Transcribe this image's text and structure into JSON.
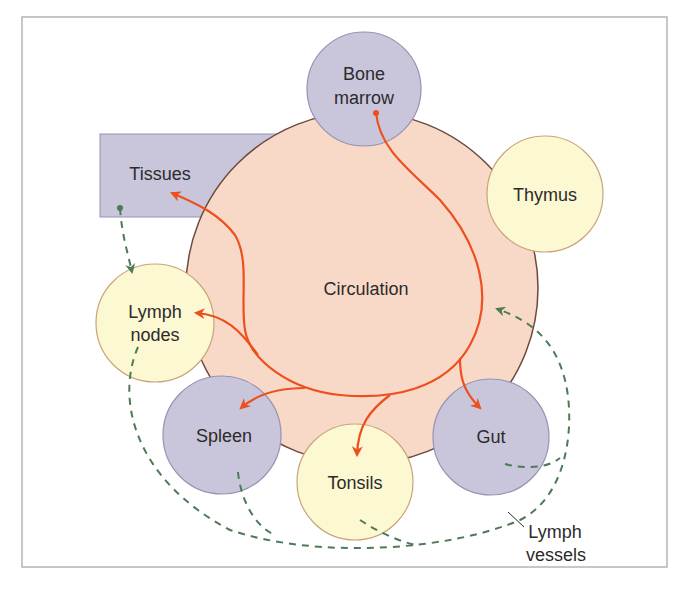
{
  "colors": {
    "frame_border": "#b5b5b5",
    "circulation_fill": "#f8d9c8",
    "circulation_stroke": "#6b4a3e",
    "purple_fill": "#c9c6dc",
    "purple_stroke": "#9792b3",
    "yellow_fill": "#fcf8d2",
    "yellow_stroke": "#c8a47a",
    "blood_arrow": "#ee4f1e",
    "lymph_arrow": "#4e7a58",
    "text": "#2b2b2b"
  },
  "nodes": {
    "circulation": {
      "label": "Circulation",
      "kind": "central-circle"
    },
    "bone_marrow": {
      "line1": "Bone",
      "line2": "marrow",
      "kind": "primary-organ"
    },
    "thymus": {
      "label": "Thymus",
      "kind": "primary-organ"
    },
    "tissues": {
      "label": "Tissues",
      "kind": "box"
    },
    "lymph_nodes": {
      "line1": "Lymph",
      "line2": "nodes",
      "kind": "secondary-organ"
    },
    "spleen": {
      "label": "Spleen",
      "kind": "secondary-organ"
    },
    "tonsils": {
      "label": "Tonsils",
      "kind": "secondary-organ"
    },
    "gut": {
      "label": "Gut",
      "kind": "secondary-organ"
    }
  },
  "annotations": {
    "lymph_vessels": {
      "line1": "Lymph",
      "line2": "vessels"
    }
  },
  "edges": [
    {
      "from": "Bone marrow",
      "to": "Circulation",
      "style": "solid-orange"
    },
    {
      "from": "Circulation",
      "to": "Tissues",
      "style": "solid-orange"
    },
    {
      "from": "Circulation",
      "to": "Lymph nodes",
      "style": "solid-orange"
    },
    {
      "from": "Circulation",
      "to": "Spleen",
      "style": "solid-orange"
    },
    {
      "from": "Circulation",
      "to": "Tonsils",
      "style": "solid-orange"
    },
    {
      "from": "Circulation",
      "to": "Gut",
      "style": "solid-orange"
    },
    {
      "from": "Tissues",
      "to": "Lymph nodes",
      "style": "dashed-green"
    },
    {
      "from": "Lymph nodes",
      "to": "Circulation",
      "style": "dashed-green"
    },
    {
      "from": "Spleen",
      "to": "Circulation",
      "style": "dashed-green"
    },
    {
      "from": "Tonsils",
      "to": "Circulation",
      "style": "dashed-green"
    },
    {
      "from": "Gut",
      "to": "Circulation",
      "style": "dashed-green"
    }
  ]
}
